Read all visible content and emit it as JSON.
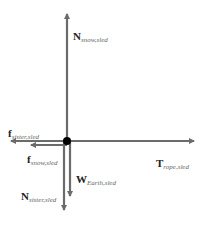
{
  "diagram": {
    "type": "free-body diagram",
    "colors": {
      "arrow": "#6b6b6b",
      "dot": "#000000",
      "text": "#222222",
      "subscript": "#666666"
    },
    "forces": [
      {
        "id": "n_snow",
        "symbol": "N",
        "subscript": "snow,sled",
        "direction": "up"
      },
      {
        "id": "f_sister",
        "symbol": "f",
        "subscript": "sister,sled",
        "direction": "left"
      },
      {
        "id": "f_snow",
        "symbol": "f",
        "subscript": "snow,sled",
        "direction": "left"
      },
      {
        "id": "t_rope",
        "symbol": "T",
        "subscript": "rope,sled",
        "direction": "right"
      },
      {
        "id": "w_earth",
        "symbol": "W",
        "subscript": "Earth,sled",
        "direction": "down"
      },
      {
        "id": "n_sister",
        "symbol": "N",
        "subscript": "sister,sled",
        "direction": "down"
      }
    ]
  }
}
